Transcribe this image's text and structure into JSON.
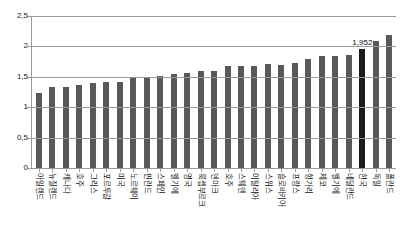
{
  "chart_data": {
    "type": "bar",
    "title": "",
    "subtitle": "",
    "xlabel": "",
    "ylabel": "",
    "ylim": [
      0,
      2.5
    ],
    "grid": true,
    "legend": null,
    "decimal_separator": ",",
    "highlight_category": "한국",
    "highlight_color": "#1c1c1c",
    "bar_color": "#595959",
    "axis_color": "#9a9a9a",
    "y_ticks": [
      "0",
      "0,5",
      "1",
      "1,5",
      "2",
      "2,5"
    ],
    "y_tick_values": [
      0,
      0.5,
      1,
      1.5,
      2,
      2.5
    ],
    "categories": [
      "아일랜드",
      "뉴질랜드",
      "캐나다",
      "호주",
      "그리스",
      "포르투갈",
      "미국",
      "노르웨이",
      "핀란드",
      "스페인",
      "벨기에",
      "영국",
      "룩셉부르크",
      "덴마크",
      "호주",
      "스웨덴",
      "이탈리아",
      "스위스",
      "슬로바키아",
      "프랑스",
      "헝가리",
      "체코",
      "벨기에",
      "네덜란드",
      "한국",
      "독일",
      "폴란드"
    ],
    "values": [
      1.24,
      1.33,
      1.33,
      1.37,
      1.4,
      1.42,
      1.41,
      1.49,
      1.49,
      1.52,
      1.54,
      1.56,
      1.6,
      1.59,
      1.67,
      1.68,
      1.68,
      1.71,
      1.69,
      1.72,
      1.8,
      1.85,
      1.85,
      1.86,
      1.952,
      2.09,
      2.18
    ],
    "value_labels": [
      "",
      "",
      "",
      "",
      "",
      "",
      "",
      "",
      "",
      "",
      "",
      "",
      "",
      "",
      "",
      "",
      "",
      "",
      "",
      "",
      "",
      "",
      "",
      "",
      "1,952",
      "",
      ""
    ]
  }
}
